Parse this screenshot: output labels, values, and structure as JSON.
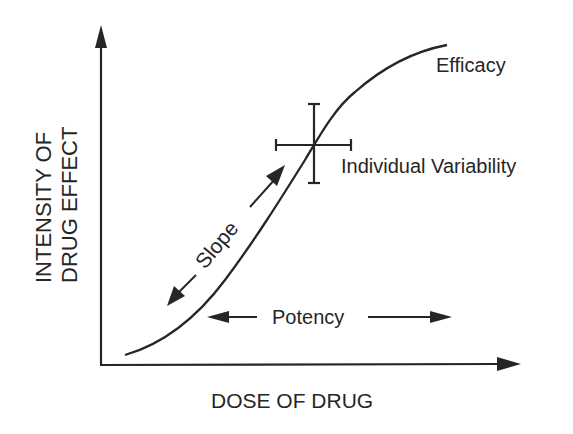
{
  "diagram": {
    "type": "dose-response curve",
    "y_axis_label_line1": "INTENSITY OF",
    "y_axis_label_line2": "DRUG EFFECT",
    "x_axis_label": "DOSE OF DRUG",
    "annotations": {
      "efficacy": "Efficacy",
      "variability": "Individual Variability",
      "slope": "Slope",
      "potency": "Potency"
    },
    "colors": {
      "ink": "#262626",
      "background": "#ffffff"
    }
  }
}
